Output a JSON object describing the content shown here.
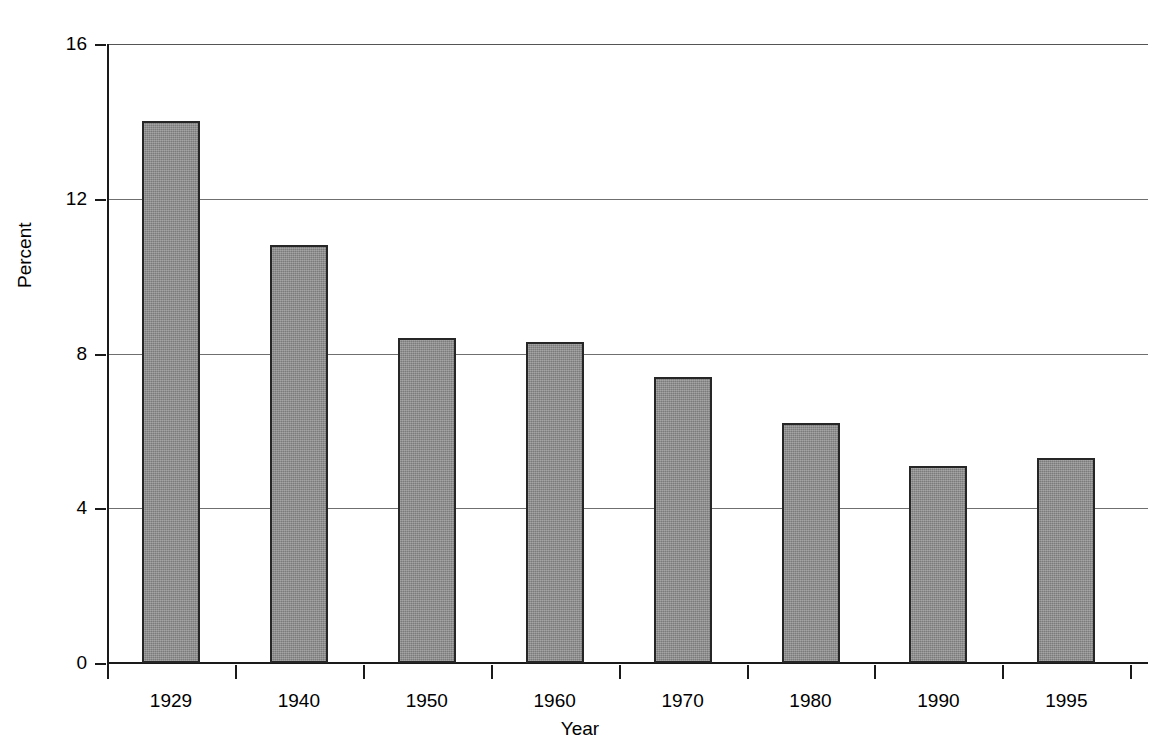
{
  "chart_data": {
    "type": "bar",
    "title": "",
    "categories": [
      "1929",
      "1940",
      "1950",
      "1960",
      "1970",
      "1980",
      "1990",
      "1995"
    ],
    "values": [
      14.0,
      10.8,
      8.4,
      8.3,
      7.4,
      6.2,
      5.1,
      5.3
    ],
    "xlabel": "Year",
    "ylabel": "Percent",
    "ylim": [
      0,
      16
    ],
    "yticks": [
      "0",
      "4",
      "8",
      "12",
      "16"
    ],
    "ytick_values": [
      0,
      4,
      8,
      12,
      16
    ],
    "grid": "horizontal",
    "legend": "none",
    "bar_fill_color": "#8a8a8a",
    "bar_border_color": "#262626",
    "gridline_color": "#6f6f6f",
    "axis_color": "#1a1a1a",
    "background_color": "#ffffff"
  },
  "axes": {
    "y_title": "Percent",
    "x_title": "Year"
  }
}
